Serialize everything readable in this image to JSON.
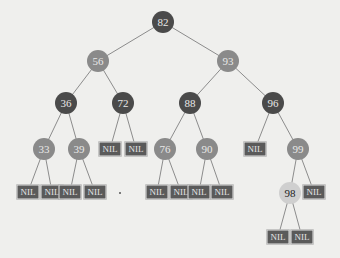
{
  "diagram": {
    "type": "red-black-tree",
    "nodes": [
      {
        "id": "n82",
        "label": "82",
        "color": "black",
        "x": 163,
        "y": 22
      },
      {
        "id": "n56",
        "label": "56",
        "color": "red",
        "x": 98,
        "y": 61
      },
      {
        "id": "n93",
        "label": "93",
        "color": "red",
        "x": 228,
        "y": 61
      },
      {
        "id": "n36",
        "label": "36",
        "color": "black",
        "x": 66,
        "y": 103
      },
      {
        "id": "n72",
        "label": "72",
        "color": "black",
        "x": 123,
        "y": 103
      },
      {
        "id": "n88",
        "label": "88",
        "color": "black",
        "x": 190,
        "y": 103
      },
      {
        "id": "n96",
        "label": "96",
        "color": "black",
        "x": 273,
        "y": 103
      },
      {
        "id": "n33",
        "label": "33",
        "color": "red",
        "x": 44,
        "y": 149
      },
      {
        "id": "n39",
        "label": "39",
        "color": "red",
        "x": 79,
        "y": 149
      },
      {
        "id": "n76",
        "label": "76",
        "color": "red",
        "x": 165,
        "y": 149
      },
      {
        "id": "n90",
        "label": "90",
        "color": "red",
        "x": 207,
        "y": 149
      },
      {
        "id": "n99",
        "label": "99",
        "color": "red",
        "x": 298,
        "y": 149
      },
      {
        "id": "n98",
        "label": "98",
        "color": "new",
        "x": 290,
        "y": 193
      }
    ],
    "nil_label": "NIL",
    "nils": [
      {
        "id": "nil1",
        "x": 110,
        "y": 149,
        "parent": "n72"
      },
      {
        "id": "nil2",
        "x": 136,
        "y": 149,
        "parent": "n72"
      },
      {
        "id": "nil3",
        "x": 255,
        "y": 149,
        "parent": "n96"
      },
      {
        "id": "nil4",
        "x": 28,
        "y": 192,
        "parent": "n33"
      },
      {
        "id": "nil5",
        "x": 52,
        "y": 192,
        "parent": "n33"
      },
      {
        "id": "nil6",
        "x": 70,
        "y": 192,
        "parent": "n39"
      },
      {
        "id": "nil7",
        "x": 95,
        "y": 192,
        "parent": "n39"
      },
      {
        "id": "nil8",
        "x": 157,
        "y": 192,
        "parent": "n76"
      },
      {
        "id": "nil9",
        "x": 181,
        "y": 192,
        "parent": "n76"
      },
      {
        "id": "nil10",
        "x": 199,
        "y": 192,
        "parent": "n90"
      },
      {
        "id": "nil11",
        "x": 222,
        "y": 192,
        "parent": "n90"
      },
      {
        "id": "nil12",
        "x": 314,
        "y": 192,
        "parent": "n99"
      },
      {
        "id": "nil13",
        "x": 278,
        "y": 237,
        "parent": "n98"
      },
      {
        "id": "nil14",
        "x": 302,
        "y": 237,
        "parent": "n98"
      }
    ],
    "edges": [
      [
        "n82",
        "n56"
      ],
      [
        "n82",
        "n93"
      ],
      [
        "n56",
        "n36"
      ],
      [
        "n56",
        "n72"
      ],
      [
        "n93",
        "n88"
      ],
      [
        "n93",
        "n96"
      ],
      [
        "n36",
        "n33"
      ],
      [
        "n36",
        "n39"
      ],
      [
        "n88",
        "n76"
      ],
      [
        "n88",
        "n90"
      ],
      [
        "n96",
        "n99"
      ],
      [
        "n99",
        "n98"
      ]
    ],
    "colors": {
      "black": "#4a4a4a",
      "red": "#8a8a8a",
      "new": "#cfcfcf",
      "nil": "#5a5a5a",
      "edge": "#8c8c8c",
      "background": "#efefed"
    }
  }
}
